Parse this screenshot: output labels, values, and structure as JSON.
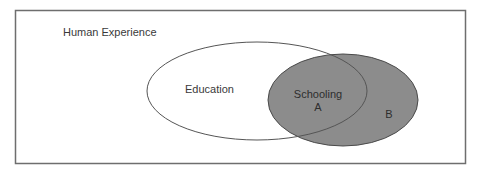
{
  "diagram": {
    "title": "Human Experience",
    "sets": [
      {
        "id": "education",
        "label": "Education",
        "fill": "#ffffff",
        "stroke": "#555555",
        "cx": 257,
        "cy": 91,
        "rx": 110,
        "ry": 49
      },
      {
        "id": "schooling",
        "label": "Schooling",
        "fill": "#8c8c8c",
        "stroke": "#4a4a4a",
        "cx": 343,
        "cy": 100,
        "rx": 75,
        "ry": 46
      }
    ],
    "regions": [
      {
        "id": "A",
        "label": "A",
        "description": "Schooling within Education"
      },
      {
        "id": "B",
        "label": "B",
        "description": "Schooling outside Education"
      }
    ],
    "frame": {
      "stroke": "#6e6e6e"
    }
  }
}
